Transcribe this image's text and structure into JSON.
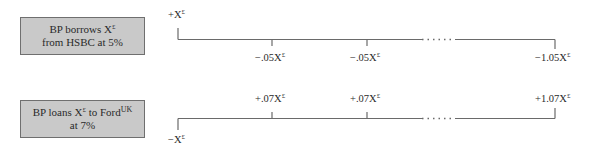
{
  "timeline_1": {
    "box": {
      "line1_prefix": "BP borrows X",
      "line1_sup": "£",
      "line2": "from HSBC at 5%"
    },
    "start_label": {
      "prefix": "+X",
      "sup": "£"
    },
    "flows": [
      {
        "prefix": "−.05X",
        "sup": "£"
      },
      {
        "prefix": "−.05X",
        "sup": "£"
      },
      {
        "prefix": "−1.05X",
        "sup": "£"
      }
    ],
    "ellipsis": "......"
  },
  "timeline_2": {
    "box": {
      "line1_prefix": "BP loans X",
      "line1_sup": "£",
      "line1_mid": " to Ford",
      "line1_sup2": "UK",
      "line2": "at 7%"
    },
    "start_label": {
      "prefix": "−X",
      "sup": "£"
    },
    "flows": [
      {
        "prefix": "+.07X",
        "sup": "£"
      },
      {
        "prefix": "+.07X",
        "sup": "£"
      },
      {
        "prefix": "+1.07X",
        "sup": "£"
      }
    ],
    "ellipsis": "......"
  },
  "colors": {
    "box_fill": "#c9c9c9",
    "box_border": "#6f6f6f",
    "line": "#6a6a6a",
    "text": "#2a2a2a"
  }
}
